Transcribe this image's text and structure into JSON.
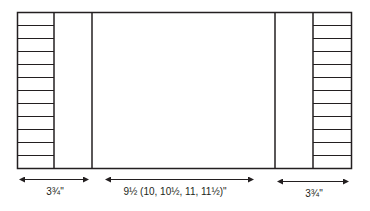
{
  "diagram": {
    "type": "schematic",
    "labels": {
      "left_width": "3¾\"",
      "center_width": "9½ (10, 10½, 11, 11½)\"",
      "right_width": "3¾\""
    },
    "colors": {
      "stroke": "#231f20",
      "background": "#ffffff"
    },
    "stripes_per_side": 12
  }
}
